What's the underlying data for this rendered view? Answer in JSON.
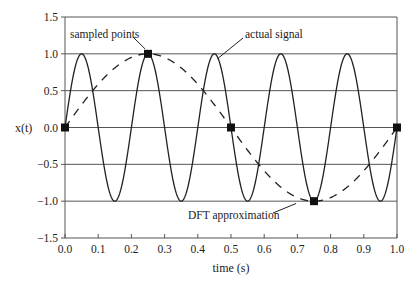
{
  "chart_data": {
    "type": "line",
    "title": "",
    "xlabel": "time (s)",
    "ylabel": "x(t)",
    "xlim": [
      0.0,
      1.0
    ],
    "ylim": [
      -1.5,
      1.5
    ],
    "x_ticks": [
      "0.0",
      "0.1",
      "0.2",
      "0.3",
      "0.4",
      "0.5",
      "0.6",
      "0.7",
      "0.8",
      "0.9",
      "1.0"
    ],
    "y_ticks": [
      "1.5",
      "1.0",
      "0.5",
      "0.0",
      "−0.5",
      "−1.0",
      "−1.5"
    ],
    "grid": "horizontal",
    "series": [
      {
        "name": "actual signal",
        "style": "solid",
        "function": "sin(2π·5·t)",
        "frequency_hz": 5,
        "amplitude": 1
      },
      {
        "name": "DFT approximation",
        "style": "dashed",
        "function": "sin(2π·1·t)",
        "frequency_hz": 1,
        "amplitude": 1
      },
      {
        "name": "sampled points",
        "style": "square-markers",
        "x": [
          0.0,
          0.25,
          0.5,
          0.75,
          1.0
        ],
        "y": [
          0,
          1,
          0,
          -1,
          0
        ]
      }
    ],
    "annotations": [
      {
        "text": "sampled points",
        "target": [
          0.25,
          1.0
        ]
      },
      {
        "text": "actual signal",
        "target": [
          0.45,
          1.0
        ]
      },
      {
        "text": "DFT approximation",
        "target": [
          0.69,
          -0.95
        ]
      }
    ]
  }
}
